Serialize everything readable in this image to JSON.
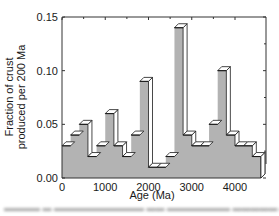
{
  "chart_data": {
    "type": "bar",
    "style": "3d-histogram",
    "xlabel": "Age (Ma)",
    "ylabel": "Fraction of crust produced per 200 Ma",
    "ylabel_lines": [
      "Fraction of crust",
      "produced per 200 Ma"
    ],
    "xlim": [
      0,
      4600
    ],
    "ylim": [
      0,
      0.15
    ],
    "xticks": [
      0,
      1000,
      2000,
      3000,
      4000
    ],
    "xtick_labels": [
      "0",
      "1000",
      "2000",
      "3000",
      "4000"
    ],
    "yticks": [
      0.0,
      0.05,
      0.1,
      0.15
    ],
    "ytick_labels": [
      "0.00",
      "0.05",
      "0.10",
      "0.15"
    ],
    "bin_width": 200,
    "bin_starts": [
      0,
      200,
      400,
      600,
      800,
      1000,
      1200,
      1400,
      1600,
      1800,
      2000,
      2200,
      2400,
      2600,
      2800,
      3000,
      3200,
      3400,
      3600,
      3800,
      4000,
      4200,
      4400
    ],
    "values": [
      0.03,
      0.04,
      0.05,
      0.02,
      0.03,
      0.06,
      0.03,
      0.02,
      0.04,
      0.09,
      0.01,
      0.01,
      0.02,
      0.14,
      0.04,
      0.03,
      0.03,
      0.05,
      0.1,
      0.04,
      0.03,
      0.03,
      0.02
    ],
    "grid": false,
    "legend": null,
    "colors": {
      "bar_fill": "#b3b3b3",
      "bar_top": "#ffffff",
      "bar_side": "#ffffff",
      "edge": "#1a1a1a",
      "axis": "#333333"
    }
  }
}
